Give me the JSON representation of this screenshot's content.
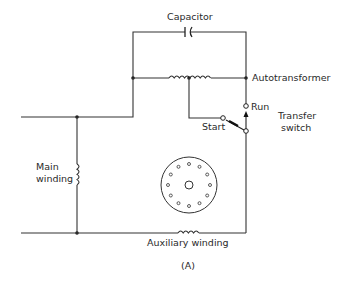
{
  "diagram": {
    "figure_label": "(A)",
    "labels": {
      "capacitor": "Capacitor",
      "autotransformer": "Autotransformer",
      "run": "Run",
      "start": "Start",
      "transfer_switch_line1": "Transfer",
      "transfer_switch_line2": "switch",
      "main_winding_line1": "Main",
      "main_winding_line2": "winding",
      "auxiliary_winding": "Auxiliary winding"
    },
    "components": [
      "capacitor",
      "autotransformer",
      "transfer-switch",
      "main-winding",
      "auxiliary-winding",
      "rotor"
    ],
    "colors": {
      "line": "#333333",
      "background": "#ffffff"
    }
  }
}
